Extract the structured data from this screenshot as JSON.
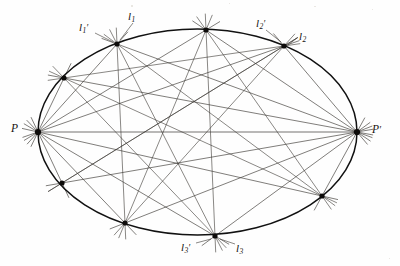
{
  "figure": {
    "background_color": "#fefefe",
    "ink_color": "#191512",
    "conic_color": "#111111",
    "ray_color": "#3b3733",
    "point_color": "#0d0b0a",
    "conic": {
      "name": "ellipse",
      "center_x": 197.5,
      "center_y": 132,
      "radius_x": 159.5,
      "radius_y": 103,
      "stroke_width": 1.5
    },
    "pencil_points": [
      {
        "id": "P",
        "label": "P",
        "prime": false,
        "x": 38,
        "y": 132
      },
      {
        "id": "Pp",
        "label": "P",
        "prime": true,
        "x": 357,
        "y": 132
      }
    ],
    "conic_points": [
      {
        "id": "A",
        "x": 64,
        "y": 78
      },
      {
        "id": "B",
        "x": 117,
        "y": 44
      },
      {
        "id": "C",
        "x": 206,
        "y": 30
      },
      {
        "id": "D",
        "x": 284,
        "y": 46
      },
      {
        "id": "E",
        "x": 322,
        "y": 196
      },
      {
        "id": "F",
        "x": 215,
        "y": 236
      },
      {
        "id": "G",
        "x": 125,
        "y": 223
      },
      {
        "id": "H",
        "x": 62,
        "y": 183
      }
    ],
    "labels": [
      {
        "id": "P",
        "text": "P",
        "sub": "",
        "prime": false,
        "anchor_point": "P",
        "css_class": "lbl-P"
      },
      {
        "id": "Pp",
        "text": "P",
        "sub": "",
        "prime": true,
        "anchor_point": "Pp",
        "css_class": "lbl-Pp"
      },
      {
        "id": "l1",
        "text": "l",
        "sub": "1",
        "prime": false,
        "anchor_point": "B",
        "css_class": "lbl-l1"
      },
      {
        "id": "l1p",
        "text": "l",
        "sub": "1",
        "prime": true,
        "anchor_point": "B",
        "css_class": "lbl-l1p"
      },
      {
        "id": "l2p",
        "text": "l",
        "sub": "2",
        "prime": true,
        "anchor_point": "D",
        "css_class": "lbl-l2p"
      },
      {
        "id": "l2",
        "text": "l",
        "sub": "2",
        "prime": false,
        "anchor_point": "D",
        "css_class": "lbl-l2"
      },
      {
        "id": "l3p",
        "text": "l",
        "sub": "3",
        "prime": true,
        "anchor_point": "F",
        "css_class": "lbl-l3p"
      },
      {
        "id": "l3",
        "text": "l",
        "sub": "3",
        "prime": false,
        "anchor_point": "F",
        "css_class": "lbl-l3"
      }
    ],
    "leader_lines": [
      {
        "id": "leader-l1",
        "x1": 133,
        "y1": 23,
        "x2": 120,
        "y2": 40
      },
      {
        "id": "leader-l1p",
        "x1": 95,
        "y1": 33,
        "x2": 113,
        "y2": 42
      },
      {
        "id": "leader-l2p",
        "x1": 266,
        "y1": 30,
        "x2": 281,
        "y2": 42
      },
      {
        "id": "leader-l2",
        "x1": 297,
        "y1": 38,
        "x2": 288,
        "y2": 45
      },
      {
        "id": "leader-l3p",
        "x1": 196,
        "y1": 243,
        "x2": 211,
        "y2": 239
      },
      {
        "id": "leader-l3",
        "x1": 235,
        "y1": 244,
        "x2": 220,
        "y2": 239
      }
    ],
    "specks": [
      {
        "x": 131,
        "y": 5,
        "w": 2,
        "h": 2
      },
      {
        "x": 314,
        "y": 6,
        "w": 2,
        "h": 1
      },
      {
        "x": 229,
        "y": 3,
        "w": 1,
        "h": 1
      },
      {
        "x": 372,
        "y": 9,
        "w": 1,
        "h": 1
      },
      {
        "x": 389,
        "y": 258,
        "w": 1,
        "h": 1
      }
    ],
    "overshoot": 16
  }
}
